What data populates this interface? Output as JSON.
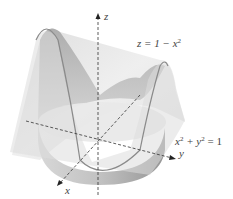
{
  "diagram": {
    "axes": {
      "z_label": "z",
      "y_label": "y",
      "x_label": "x"
    },
    "surfaces": [
      {
        "name": "parabolic-cylinder",
        "equation_lhs": "z = 1 − x",
        "equation_exp": "2"
      },
      {
        "name": "circular-cylinder",
        "equation_part1": "x",
        "exp1": "2",
        "equation_part2": " + y",
        "exp2": "2",
        "equation_rest": " = 1"
      }
    ],
    "colors": {
      "surface_light": "#e6e6e6",
      "surface_mid": "#cfcfcf",
      "surface_dark": "#9e9e9e",
      "curve": "#8a8a8a",
      "axis": "#333333"
    }
  }
}
